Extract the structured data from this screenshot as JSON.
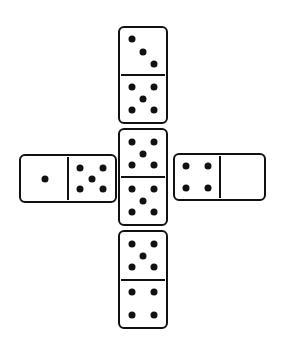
{
  "diagram": {
    "type": "domino-cross-puzzle",
    "ink_color": "#111111",
    "background": "#ffffff",
    "dominoes": [
      {
        "id": "top",
        "orientation": "vertical",
        "x": 118,
        "y": 26,
        "w": 50,
        "h": 98,
        "halves": [
          3,
          5
        ]
      },
      {
        "id": "middle",
        "orientation": "vertical",
        "x": 118,
        "y": 128,
        "w": 50,
        "h": 98,
        "halves": [
          5,
          5
        ]
      },
      {
        "id": "bottom",
        "orientation": "vertical",
        "x": 118,
        "y": 230,
        "w": 50,
        "h": 99,
        "halves": [
          5,
          4
        ]
      },
      {
        "id": "left",
        "orientation": "horizontal",
        "x": 19,
        "y": 154,
        "w": 98,
        "h": 49,
        "halves": [
          1,
          5
        ]
      },
      {
        "id": "right",
        "orientation": "horizontal",
        "x": 173,
        "y": 153,
        "w": 93,
        "h": 48,
        "halves": [
          4,
          0
        ]
      }
    ]
  }
}
